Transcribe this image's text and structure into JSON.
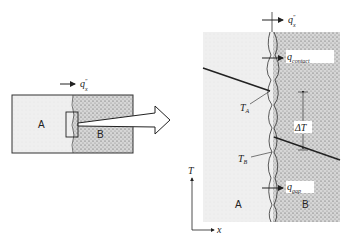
{
  "diagram": {
    "left_panel": {
      "label_a": "A",
      "label_b": "B",
      "flux_label": "q",
      "flux_superscript": "″",
      "flux_subscript": "x"
    },
    "right_panel": {
      "label_a": "A",
      "label_b": "B",
      "flux_label": "q",
      "flux_superscript": "″",
      "flux_subscript": "x",
      "contact_flux_label": "q",
      "contact_flux_superscript": "″",
      "contact_flux_subscript": "contact",
      "gap_flux_label": "q",
      "gap_flux_superscript": "″",
      "gap_flux_subscript": "gap",
      "temp_a_label": "T",
      "temp_a_subscript": "A",
      "temp_b_label": "T",
      "temp_b_subscript": "B",
      "delta_t_label": "ΔT"
    },
    "axes": {
      "y_label": "T",
      "x_label": "x"
    },
    "colors": {
      "material_a": "#ececec",
      "material_b": "#c9c9c9",
      "line": "#222222"
    }
  }
}
